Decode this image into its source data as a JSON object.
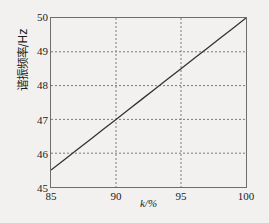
{
  "chart_data": {
    "type": "line",
    "title": "",
    "xlabel": "k/%",
    "ylabel": "谐振频率/Hz",
    "xlim": [
      85,
      100
    ],
    "ylim": [
      45,
      50
    ],
    "xticks": [
      85,
      90,
      95,
      100
    ],
    "yticks": [
      45,
      46,
      47,
      48,
      49,
      50
    ],
    "xtick_labels": [
      "85",
      "90",
      "95",
      "100"
    ],
    "ytick_labels": [
      "45",
      "46",
      "47",
      "48",
      "49",
      "50"
    ],
    "grid": true,
    "grid_style": "dotted",
    "legend": null,
    "series": [
      {
        "name": "resonant frequency",
        "color": "#333333",
        "x": [
          85,
          86,
          87,
          88,
          89,
          90,
          91,
          92,
          93,
          94,
          95,
          96,
          97,
          98,
          99,
          100
        ],
        "values": [
          45.5,
          45.8,
          46.1,
          46.4,
          46.7,
          47.0,
          47.3,
          47.6,
          47.9,
          48.2,
          48.5,
          48.8,
          49.1,
          49.4,
          49.7,
          50.0
        ]
      }
    ]
  },
  "axes": {
    "frame_color": "#6e6e6e",
    "grid_color": "#7a7a7a",
    "background": "#f2f1ef"
  }
}
